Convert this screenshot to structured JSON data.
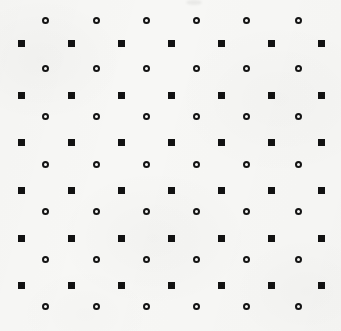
{
  "figure": {
    "width": 341,
    "height": 331,
    "background_color": "#f7f7f5",
    "marker_color": "#121212"
  },
  "chart_data": {
    "type": "scatter",
    "title": "",
    "subtitle": "",
    "xlabel": "",
    "ylabel": "",
    "xlim": [
      0,
      341
    ],
    "ylim": [
      0,
      331
    ],
    "grid": false,
    "legend": "none",
    "axes_visible": false,
    "tick_labels_x": [],
    "tick_labels_y": [],
    "annotations": [],
    "series": [
      {
        "name": "filled-square-lattice",
        "marker": "square",
        "marker_style": "filled",
        "marker_size_px": 7,
        "color": "#121212",
        "count": 42,
        "columns_x": [
          21,
          71,
          121,
          171,
          221,
          271,
          321
        ],
        "rows_y": [
          43,
          95,
          142,
          190,
          238,
          285
        ]
      },
      {
        "name": "open-circle-lattice",
        "marker": "circle",
        "marker_style": "open",
        "marker_size_px": 7,
        "stroke_width_px": 2,
        "color": "#141414",
        "count": 42,
        "columns_x": [
          45,
          96,
          146,
          196,
          246,
          298
        ],
        "rows_y": [
          20,
          68,
          116,
          164,
          211,
          259,
          306
        ]
      }
    ]
  }
}
